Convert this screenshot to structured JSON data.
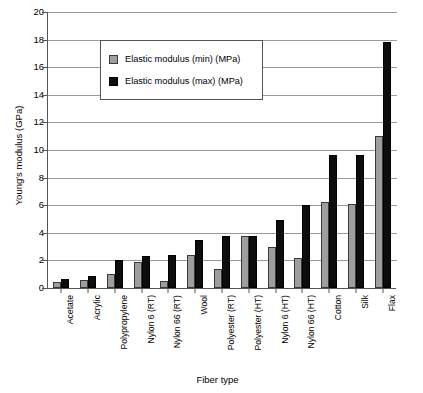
{
  "chart_data": {
    "type": "bar",
    "title": "",
    "xlabel": "Fiber type",
    "ylabel": "Young's modulus (GPa)",
    "ylim": [
      0,
      20
    ],
    "ytick_step": 2,
    "yticks": [
      0,
      2,
      4,
      6,
      8,
      10,
      12,
      14,
      16,
      18,
      20
    ],
    "ytick_labels": [
      "0",
      "2",
      "4",
      "6",
      "8",
      "10",
      "12",
      "14",
      "16",
      "18",
      "20"
    ],
    "grid": "horizontal",
    "legend_position": "upper-left-inside",
    "categories": [
      "Acetate",
      "Acrylic",
      "Polypropylene",
      "Nylon 6 (RT)",
      "Nylon 66 (RT)",
      "Wool",
      "Polyester (RT)",
      "Polyester (HT)",
      "Nylon 6 (HT)",
      "Nylon 66 (HT)",
      "Cotton",
      "Silk",
      "Flax"
    ],
    "series": [
      {
        "name": "Elastic modulus (min) (MPa)",
        "color": "#9e9e9e",
        "values": [
          0.45,
          0.6,
          1.0,
          1.9,
          0.5,
          2.4,
          1.35,
          3.75,
          2.95,
          2.2,
          6.2,
          6.1,
          11.0
        ]
      },
      {
        "name": "Elastic modulus (max) (MPa)",
        "color": "#0d0d0d",
        "values": [
          0.65,
          0.85,
          2.0,
          2.3,
          2.4,
          3.5,
          3.75,
          3.75,
          4.9,
          6.0,
          9.65,
          9.65,
          17.8
        ]
      }
    ]
  },
  "legend": {
    "items": [
      {
        "label": "Elastic modulus (min) (MPa)",
        "swatch": "min"
      },
      {
        "label": "Elastic modulus (max) (MPa)",
        "swatch": "max"
      }
    ]
  }
}
